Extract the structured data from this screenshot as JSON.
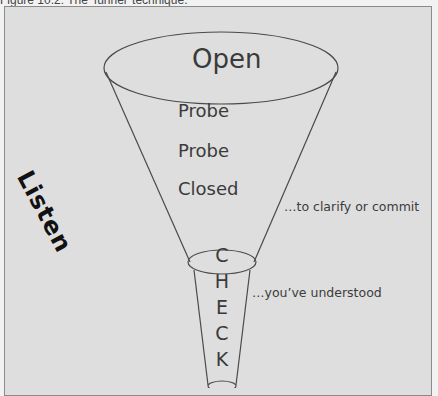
{
  "caption": "Figure 10.2: The ‘funnel’ technique.",
  "funnel": {
    "top_label": "Open",
    "stages": [
      "Probe",
      "Probe",
      "Closed"
    ],
    "side_label": "Listen",
    "check_letters": [
      "C",
      "H",
      "E",
      "C",
      "K"
    ],
    "annotations": {
      "clarify": "…to clarify or commit",
      "understood": "…you’ve understood"
    }
  },
  "colors": {
    "background": "#dedede",
    "line": "#4a4a4a",
    "text": "#3a3a3a",
    "frame_border": "#8a8a8a"
  }
}
